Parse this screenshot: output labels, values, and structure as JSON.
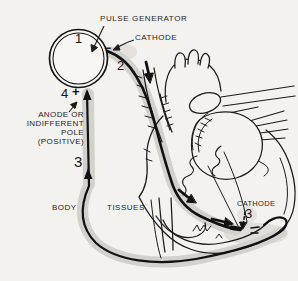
{
  "figure": {
    "title_context": "Pacemaker circuit diagram",
    "colors": {
      "background": "#f4f2ef",
      "ink": "#1b1b1b",
      "halo": "#c9c6c0"
    },
    "labels": {
      "pulse_generator": "PULSE GENERATOR",
      "cathode_top": "CATHODE",
      "cathode_apex": "CATHODE",
      "anode_line1": "ANODE OR",
      "anode_line2": "INDIFFERENT",
      "anode_line3": "POLE",
      "anode_line4": "(POSITIVE)",
      "body": "BODY",
      "tissues": "TISSUES",
      "num1": "1",
      "num2": "2",
      "num3_left": "3",
      "num3_apex": "3",
      "num4": "4",
      "plus": "+",
      "minus": "−"
    }
  }
}
